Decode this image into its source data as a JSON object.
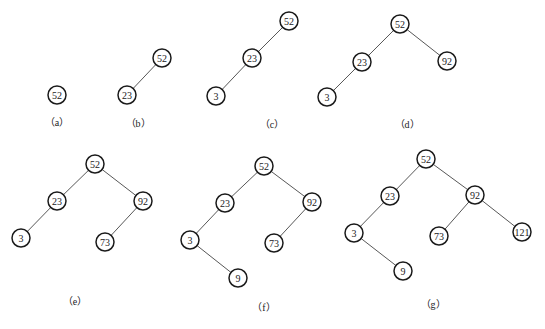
{
  "node_radius": 9,
  "colors": {
    "node_stroke": "#1a1a1a",
    "edge": "#444444",
    "text": "#222222",
    "background": "#ffffff"
  },
  "trees": [
    {
      "caption": "（a）",
      "caption_pos": [
        57,
        126
      ],
      "nodes": [
        {
          "id": "n52",
          "label": "52",
          "x": 57,
          "y": 95
        }
      ],
      "edges": []
    },
    {
      "caption": "（b）",
      "caption_pos": [
        138,
        127
      ],
      "nodes": [
        {
          "id": "n52",
          "label": "52",
          "x": 162,
          "y": 58
        },
        {
          "id": "n23",
          "label": "23",
          "x": 127,
          "y": 95
        }
      ],
      "edges": [
        [
          "n52",
          "n23"
        ]
      ]
    },
    {
      "caption": "（c）",
      "caption_pos": [
        272,
        128
      ],
      "nodes": [
        {
          "id": "n52",
          "label": "52",
          "x": 289,
          "y": 21
        },
        {
          "id": "n23",
          "label": "23",
          "x": 252,
          "y": 58
        },
        {
          "id": "n3",
          "label": "3",
          "x": 216,
          "y": 96
        }
      ],
      "edges": [
        [
          "n52",
          "n23"
        ],
        [
          "n23",
          "n3"
        ]
      ]
    },
    {
      "caption": "（d）",
      "caption_pos": [
        407,
        128
      ],
      "nodes": [
        {
          "id": "n52",
          "label": "52",
          "x": 400,
          "y": 24
        },
        {
          "id": "n23",
          "label": "23",
          "x": 362,
          "y": 62
        },
        {
          "id": "n92",
          "label": "92",
          "x": 447,
          "y": 61
        },
        {
          "id": "n3",
          "label": "3",
          "x": 327,
          "y": 97
        }
      ],
      "edges": [
        [
          "n52",
          "n23"
        ],
        [
          "n52",
          "n92"
        ],
        [
          "n23",
          "n3"
        ]
      ]
    },
    {
      "caption": "（e）",
      "caption_pos": [
        75,
        305
      ],
      "nodes": [
        {
          "id": "n52",
          "label": "52",
          "x": 95,
          "y": 164
        },
        {
          "id": "n23",
          "label": "23",
          "x": 57,
          "y": 201
        },
        {
          "id": "n92",
          "label": "92",
          "x": 143,
          "y": 201
        },
        {
          "id": "n3",
          "label": "3",
          "x": 21,
          "y": 238
        },
        {
          "id": "n73",
          "label": "73",
          "x": 105,
          "y": 242
        }
      ],
      "edges": [
        [
          "n52",
          "n23"
        ],
        [
          "n52",
          "n92"
        ],
        [
          "n23",
          "n3"
        ],
        [
          "n92",
          "n73"
        ]
      ]
    },
    {
      "caption": "（f）",
      "caption_pos": [
        264,
        311
      ],
      "nodes": [
        {
          "id": "n52",
          "label": "52",
          "x": 264,
          "y": 166
        },
        {
          "id": "n23",
          "label": "23",
          "x": 225,
          "y": 203
        },
        {
          "id": "n92",
          "label": "92",
          "x": 312,
          "y": 202
        },
        {
          "id": "n3",
          "label": "3",
          "x": 190,
          "y": 240
        },
        {
          "id": "n73",
          "label": "73",
          "x": 274,
          "y": 243
        },
        {
          "id": "n9",
          "label": "9",
          "x": 238,
          "y": 278
        }
      ],
      "edges": [
        [
          "n52",
          "n23"
        ],
        [
          "n52",
          "n92"
        ],
        [
          "n23",
          "n3"
        ],
        [
          "n92",
          "n73"
        ],
        [
          "n3",
          "n9"
        ]
      ]
    },
    {
      "caption": "（g）",
      "caption_pos": [
        433,
        308
      ],
      "nodes": [
        {
          "id": "n52",
          "label": "52",
          "x": 426,
          "y": 159
        },
        {
          "id": "n23",
          "label": "23",
          "x": 390,
          "y": 196
        },
        {
          "id": "n92",
          "label": "92",
          "x": 475,
          "y": 195
        },
        {
          "id": "n3",
          "label": "3",
          "x": 354,
          "y": 233
        },
        {
          "id": "n73",
          "label": "73",
          "x": 439,
          "y": 236
        },
        {
          "id": "n121",
          "label": "121",
          "x": 522,
          "y": 232
        },
        {
          "id": "n9",
          "label": "9",
          "x": 403,
          "y": 271
        }
      ],
      "edges": [
        [
          "n52",
          "n23"
        ],
        [
          "n52",
          "n92"
        ],
        [
          "n23",
          "n3"
        ],
        [
          "n92",
          "n73"
        ],
        [
          "n92",
          "n121"
        ],
        [
          "n3",
          "n9"
        ]
      ]
    }
  ]
}
